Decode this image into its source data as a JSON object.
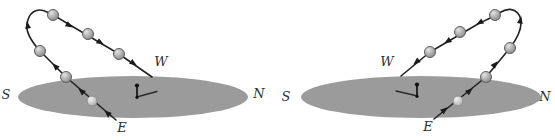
{
  "figure": {
    "panels": [
      {
        "id": "left-diagram",
        "compass_labels": {
          "south": "S",
          "west": "W",
          "north": "N",
          "east": "E"
        },
        "sun_ball_count": 6
      },
      {
        "id": "right-diagram",
        "compass_labels": {
          "south": "S",
          "west": "W",
          "north": "N",
          "east": "E"
        },
        "sun_ball_count": 6
      }
    ],
    "colors": {
      "background": "#ffffff",
      "ground": "#9b9b9b",
      "path_ink": "#222222",
      "label_ink": "#2f2f2f",
      "ball_fill": "#b0b0b0"
    },
    "glyphs": {
      "sun_ball": "shaded-sphere",
      "direction_arrow": "filled-triangle-arrowhead",
      "gnomon": "vertical-pin",
      "gnomon_shadow": "thin-line"
    }
  }
}
